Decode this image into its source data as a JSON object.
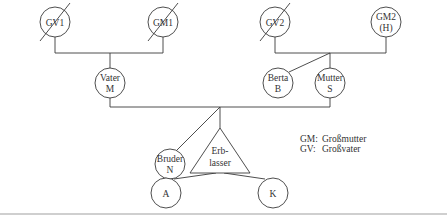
{
  "diagram": {
    "type": "family-tree",
    "top_cut_text": "…",
    "nodes": {
      "gv1": {
        "line1": "GV1",
        "line2": "",
        "crossed": true
      },
      "gm1": {
        "line1": "GM1",
        "line2": "",
        "crossed": true
      },
      "gv2": {
        "line1": "GV2",
        "line2": "",
        "crossed": true
      },
      "gm2": {
        "line1": "GM2",
        "line2": "(H)",
        "crossed": false
      },
      "vater": {
        "line1": "Vater",
        "line2": "M"
      },
      "berta": {
        "line1": "Berta",
        "line2": "B"
      },
      "mutter": {
        "line1": "Mutter",
        "line2": "S"
      },
      "bruder": {
        "line1": "Bruder",
        "line2": "N"
      },
      "erblasser": {
        "line1": "Erb-",
        "line2": "lasser",
        "shape": "triangle"
      },
      "a": {
        "line1": "A"
      },
      "k": {
        "line1": "K"
      }
    },
    "legend": [
      {
        "abbr": "GM:",
        "meaning": "Großmutter"
      },
      {
        "abbr": "GV:",
        "meaning": "Großvater"
      }
    ]
  }
}
